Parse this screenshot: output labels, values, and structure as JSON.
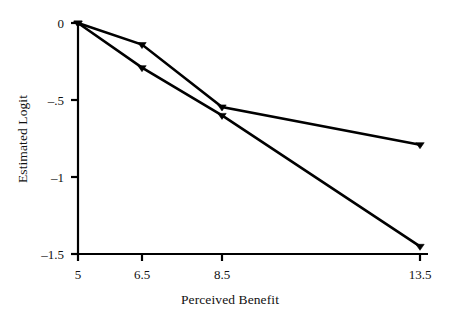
{
  "chart_data": {
    "type": "line",
    "title": "",
    "xlabel": "Perceived Benefit",
    "ylabel": "Estimated Logit",
    "x": [
      5,
      6.5,
      8.5,
      13.5
    ],
    "xtick_labels": [
      "5",
      "6.5",
      "8.5",
      "13.5"
    ],
    "ytick_labels": [
      "0",
      "–.5",
      "–1",
      "–1.5"
    ],
    "ytick_values": [
      0,
      -0.5,
      -1,
      -1.5
    ],
    "ylim": [
      -1.5,
      0
    ],
    "xlim": [
      5,
      13.5
    ],
    "grid": false,
    "legend": "none",
    "series": [
      {
        "name": "upper-line",
        "color": "#000000",
        "marker": "triangle",
        "values": [
          0,
          -0.14,
          -0.545,
          -0.79
        ]
      },
      {
        "name": "lower-line",
        "color": "#000000",
        "marker": "triangle",
        "values": [
          0,
          -0.29,
          -0.6,
          -1.45
        ]
      }
    ],
    "axis_color": "#000000",
    "background": "#ffffff"
  },
  "figure": {
    "axis_title_x": "Perceived Benefit",
    "axis_title_y": "Estimated Logit"
  }
}
